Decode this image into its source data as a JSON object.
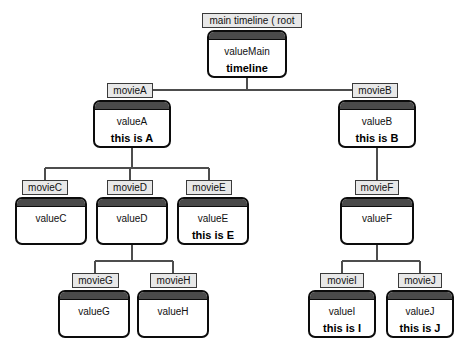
{
  "diagram": {
    "background_color": "#ffffff",
    "node_border_color": "#0c0c0c",
    "node_header_color": "#4a4a4a",
    "node_body_color": "#ffffff",
    "chip_fill_color": "#e8e8e8",
    "edge_color": "#4d4d4d"
  },
  "nodes": [
    {
      "id": "root",
      "chip": "main timeline ( root",
      "value": "valueMain",
      "sub": "timeline",
      "chip_x": 202,
      "chip_y": 13,
      "chip_w": 100,
      "x": 207,
      "y": 30,
      "w": 80,
      "h": 48
    },
    {
      "id": "a",
      "chip": "movieA",
      "value": "valueA",
      "sub": "this is A",
      "chip_x": 107,
      "chip_y": 83,
      "chip_w": 46,
      "x": 93,
      "y": 100,
      "w": 78,
      "h": 48
    },
    {
      "id": "b",
      "chip": "movieB",
      "value": "valueB",
      "sub": "this is B",
      "chip_x": 352,
      "chip_y": 83,
      "chip_w": 46,
      "x": 338,
      "y": 100,
      "w": 78,
      "h": 48
    },
    {
      "id": "c",
      "chip": "movieC",
      "value": "valueC",
      "sub": "",
      "chip_x": 22,
      "chip_y": 180,
      "chip_w": 46,
      "x": 15,
      "y": 197,
      "w": 72,
      "h": 48
    },
    {
      "id": "d",
      "chip": "movieD",
      "value": "valueD",
      "sub": "",
      "chip_x": 107,
      "chip_y": 180,
      "chip_w": 46,
      "x": 96,
      "y": 197,
      "w": 72,
      "h": 48
    },
    {
      "id": "e",
      "chip": "movieE",
      "value": "valueE",
      "sub": "this is E",
      "chip_x": 186,
      "chip_y": 180,
      "chip_w": 46,
      "x": 177,
      "y": 197,
      "w": 72,
      "h": 48
    },
    {
      "id": "f",
      "chip": "movieF",
      "value": "valueF",
      "sub": "",
      "chip_x": 355,
      "chip_y": 180,
      "chip_w": 44,
      "x": 340,
      "y": 197,
      "w": 74,
      "h": 48
    },
    {
      "id": "g",
      "chip": "movieG",
      "value": "valueG",
      "sub": "",
      "chip_x": 72,
      "chip_y": 273,
      "chip_w": 47,
      "x": 58,
      "y": 290,
      "w": 72,
      "h": 48
    },
    {
      "id": "h",
      "chip": "movieH",
      "value": "valueH",
      "sub": "",
      "chip_x": 150,
      "chip_y": 273,
      "chip_w": 47,
      "x": 137,
      "y": 290,
      "w": 72,
      "h": 48
    },
    {
      "id": "i",
      "chip": "movieI",
      "value": "valueI",
      "sub": "this is I",
      "chip_x": 320,
      "chip_y": 273,
      "chip_w": 44,
      "x": 308,
      "y": 290,
      "w": 68,
      "h": 48
    },
    {
      "id": "j",
      "chip": "movieJ",
      "value": "valueJ",
      "sub": "this is J",
      "chip_x": 398,
      "chip_y": 273,
      "chip_w": 44,
      "x": 386,
      "y": 290,
      "w": 68,
      "h": 48
    }
  ],
  "edges": [
    {
      "from": "root",
      "to": "a",
      "kind": "bus"
    },
    {
      "from": "root",
      "to": "b",
      "kind": "bus"
    },
    {
      "from": "a",
      "to": "c",
      "kind": "bus"
    },
    {
      "from": "a",
      "to": "d",
      "kind": "bus"
    },
    {
      "from": "a",
      "to": "e",
      "kind": "bus"
    },
    {
      "from": "b",
      "to": "f",
      "kind": "straight"
    },
    {
      "from": "d",
      "to": "g",
      "kind": "bus"
    },
    {
      "from": "d",
      "to": "h",
      "kind": "bus"
    },
    {
      "from": "f",
      "to": "i",
      "kind": "bus"
    },
    {
      "from": "f",
      "to": "j",
      "kind": "bus"
    }
  ]
}
